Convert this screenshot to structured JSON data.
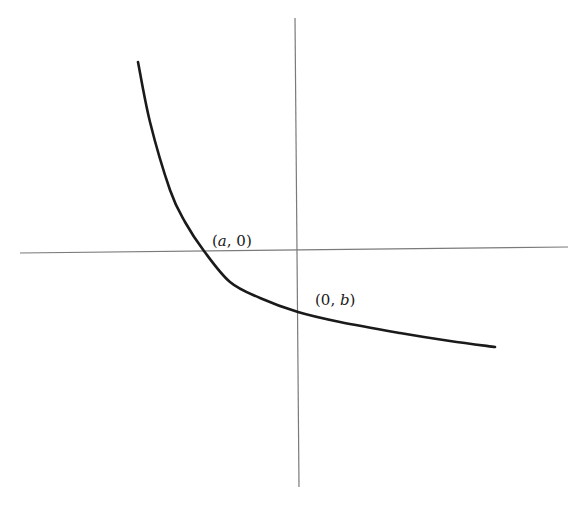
{
  "chart_data": {
    "type": "line",
    "title": "",
    "xlabel": "",
    "ylabel": "",
    "grid": false,
    "axes": {
      "x_axis": {
        "from": [
          20,
          253
        ],
        "to": [
          568,
          247
        ],
        "color": "#7a7a7a"
      },
      "y_axis": {
        "from": [
          295,
          18
        ],
        "to": [
          299,
          487
        ],
        "color": "#7a7a7a"
      }
    },
    "series": [
      {
        "name": "curve",
        "color": "#1a1a1a",
        "pixel_points": [
          [
            138,
            62
          ],
          [
            150,
            122
          ],
          [
            170,
            190
          ],
          [
            185,
            222
          ],
          [
            204,
            251
          ],
          [
            230,
            282
          ],
          [
            260,
            298
          ],
          [
            298,
            312
          ],
          [
            340,
            322
          ],
          [
            400,
            333
          ],
          [
            450,
            341
          ],
          [
            495,
            347
          ]
        ]
      }
    ],
    "annotations": [
      {
        "text": "(a, 0)",
        "point": "x-intercept",
        "pixel": [
          204,
          251
        ]
      },
      {
        "text": "(0, b)",
        "point": "y-intercept",
        "pixel": [
          298,
          312
        ]
      }
    ]
  },
  "labels": {
    "x_intercept": {
      "open": "(",
      "var": "a",
      "rest": ", 0)"
    },
    "y_intercept": {
      "open": "(0, ",
      "var": "b",
      "close": ")"
    }
  }
}
